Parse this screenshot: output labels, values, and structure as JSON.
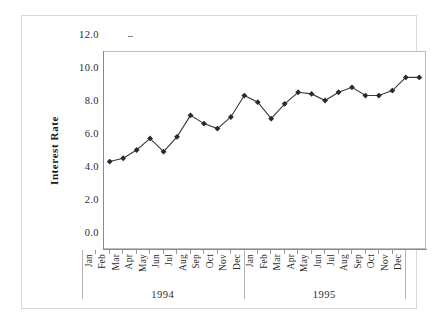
{
  "chart_data": {
    "type": "line",
    "title": "",
    "xlabel": "",
    "ylabel": "Interest Rate",
    "ylim": [
      0.0,
      12.0
    ],
    "ytick_labels": [
      "12.0",
      "10.0",
      "8.0",
      "6.0",
      "4.0",
      "2.0",
      "0.0"
    ],
    "ytick_values": [
      12.0,
      10.0,
      8.0,
      6.0,
      4.0,
      2.0,
      0.0
    ],
    "grid": false,
    "legend": "none",
    "marker": "filled-diamond",
    "line_color": "#3a3a3a",
    "marker_color": "#2a2a2a",
    "categories": [
      "Jan",
      "Feb",
      "Mar",
      "Apr",
      "May",
      "Jun",
      "Jul",
      "Aug",
      "Sep",
      "Oct",
      "Nov",
      "Dec",
      "Jan",
      "Feb",
      "Mar",
      "Apr",
      "May",
      "Jun",
      "Jul",
      "Aug",
      "Sep",
      "Oct",
      "Nov",
      "Dec"
    ],
    "group_labels": [
      "1994",
      "1995"
    ],
    "groups": [
      {
        "label": "1994",
        "start_index": 0,
        "end_index": 11
      },
      {
        "label": "1995",
        "start_index": 12,
        "end_index": 23
      }
    ],
    "values": [
      5.3,
      5.5,
      6.0,
      6.7,
      5.9,
      6.8,
      8.1,
      7.6,
      7.3,
      8.0,
      9.3,
      8.9,
      7.9,
      8.8,
      9.5,
      9.4,
      9.0,
      9.5,
      9.8,
      9.3,
      9.3,
      9.6,
      10.4,
      10.4
    ],
    "series": [
      {
        "name": "Interest Rate",
        "values": [
          5.3,
          5.5,
          6.0,
          6.7,
          5.9,
          6.8,
          8.1,
          7.6,
          7.3,
          8.0,
          9.3,
          8.9,
          7.9,
          8.8,
          9.5,
          9.4,
          9.0,
          9.5,
          9.8,
          9.3,
          9.3,
          9.6,
          10.4,
          10.4
        ]
      }
    ]
  }
}
